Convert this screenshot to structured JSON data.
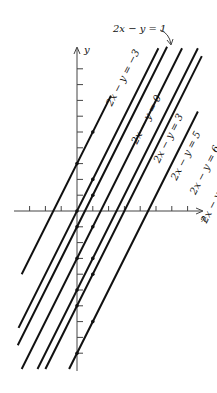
{
  "figure": {
    "top_label": "2x − y = 1",
    "x_axis_label": "x",
    "y_axis_label": "y",
    "lines": [
      {
        "c": -3,
        "label": "2x − y = −3",
        "y_top": 7.3,
        "y_bot": -4.0,
        "label_pos": [
          2.2,
          6.6
        ]
      },
      {
        "c": 0,
        "label": "2x − y = 0",
        "y_top": 10.3,
        "y_bot": -7.4,
        "label_pos": [
          3.8,
          4.2
        ]
      },
      {
        "c": 1,
        "label": "2x − y = 1",
        "y_top": 10.4,
        "y_bot": -8.5,
        "label_pos": null
      },
      {
        "c": 3,
        "label": "2x − y = 3",
        "y_top": 10.3,
        "y_bot": -10.0,
        "label_pos": [
          5.2,
          3.0
        ]
      },
      {
        "c": 5,
        "label": "2x − y = 5",
        "y_top": 10.3,
        "y_bot": -10.0,
        "label_pos": [
          6.3,
          1.9
        ]
      },
      {
        "c": 6,
        "label": "2x − y = 6",
        "y_top": 9.8,
        "y_bot": -10.0,
        "label_pos": [
          7.5,
          1.0
        ]
      },
      {
        "c": 9,
        "label": "2x − y = 9",
        "y_top": 6.3,
        "y_bot": -10.0,
        "label_pos": [
          8.2,
          -0.8
        ]
      }
    ],
    "points": [
      [
        0,
        3
      ],
      [
        1,
        5
      ],
      [
        0,
        0
      ],
      [
        1,
        2
      ],
      [
        0,
        -1
      ],
      [
        1,
        1
      ],
      [
        0,
        -3
      ],
      [
        1,
        -1
      ],
      [
        0,
        -5
      ],
      [
        1,
        -3
      ],
      [
        0,
        -6
      ],
      [
        1,
        -4
      ],
      [
        0,
        -9
      ],
      [
        1,
        -7
      ]
    ],
    "x_ticks": [
      -3,
      -2,
      -1,
      1,
      2,
      3,
      4,
      5,
      6,
      7
    ],
    "y_ticks": [
      -9,
      -8,
      -7,
      -6,
      -5,
      -4,
      -3,
      -2,
      -1,
      1,
      2,
      3,
      4,
      5,
      6,
      7,
      8,
      9
    ]
  }
}
